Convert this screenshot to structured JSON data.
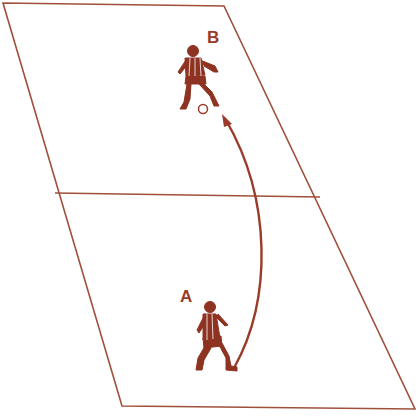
{
  "diagram": {
    "type": "soccer-drill",
    "colors": {
      "line": "#a0503a",
      "figure": "#8e3322",
      "background": "#ffffff"
    },
    "field": {
      "corners": {
        "top_left": [
          3,
          3
        ],
        "top_right": [
          224,
          6
        ],
        "bottom_right": [
          415,
          409
        ],
        "bottom_left": [
          122,
          406
        ]
      },
      "halfway_line": {
        "from": [
          55,
          193
        ],
        "to": [
          320,
          197
        ]
      }
    },
    "players": [
      {
        "id": "B",
        "label": "B",
        "position": [
          198,
          105
        ],
        "role": "receiver"
      },
      {
        "id": "A",
        "label": "A",
        "position": [
          215,
          338
        ],
        "role": "passer"
      }
    ],
    "ball": {
      "position": [
        204,
        109
      ]
    },
    "pass": {
      "from": "A",
      "to": "B",
      "path": "curved",
      "start": [
        234,
        370
      ],
      "end": [
        225,
        118
      ]
    }
  }
}
